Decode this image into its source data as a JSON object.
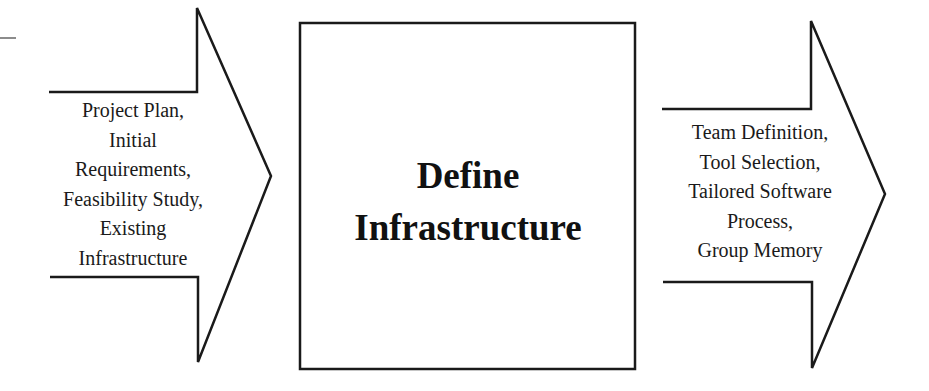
{
  "diagram": {
    "input_arrow": {
      "lines": [
        "Project Plan,",
        "Initial",
        "Requirements,",
        "Feasibility Study,",
        "Existing",
        "Infrastructure"
      ]
    },
    "process_box": {
      "lines": [
        "Define",
        "Infrastructure"
      ]
    },
    "output_arrow": {
      "lines": [
        "Team Definition,",
        "Tool Selection,",
        "Tailored Software",
        "Process,",
        "Group Memory"
      ]
    },
    "colors": {
      "stroke": "#1a1a1a",
      "background": "#ffffff",
      "stub_line": "#666666"
    }
  }
}
